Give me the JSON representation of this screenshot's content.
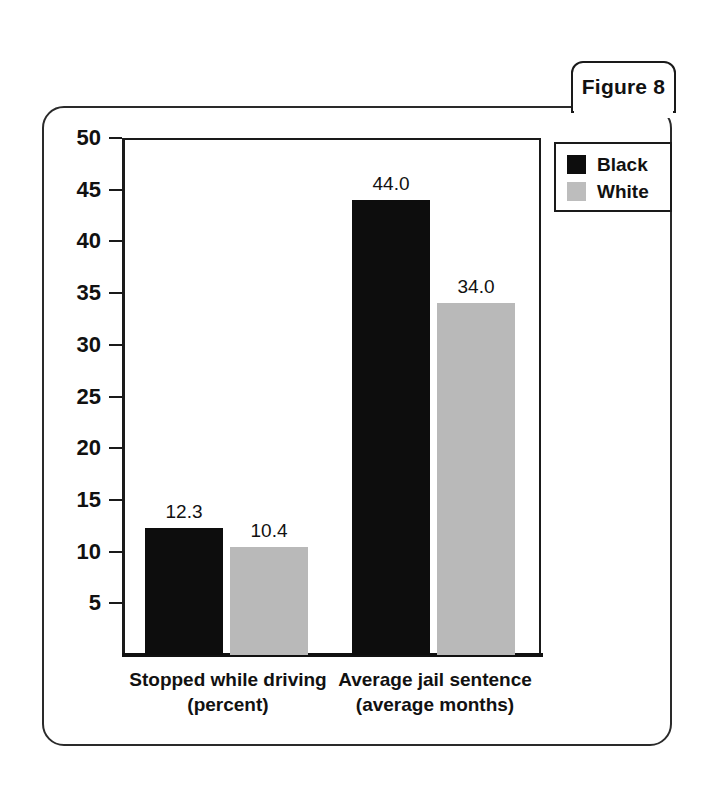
{
  "figure": {
    "tab_label": "Figure 8"
  },
  "legend": {
    "entries": [
      {
        "label": "Black",
        "color": "#0d0d0d",
        "swatch": "black-swatch-icon"
      },
      {
        "label": "White",
        "color": "#bdbdbd",
        "swatch": "white-swatch-icon"
      }
    ]
  },
  "axis": {
    "y_ticks": [
      "50",
      "45",
      "40",
      "35",
      "30",
      "25",
      "20",
      "15",
      "10",
      "5"
    ]
  },
  "categories": [
    {
      "line1": "Stopped while driving",
      "line2": "(percent)"
    },
    {
      "line1": "Average jail sentence",
      "line2": "(average months)"
    }
  ],
  "bar_labels": {
    "g0_black": "12.3",
    "g0_white": "10.4",
    "g1_black": "44.0",
    "g1_white": "34.0"
  },
  "chart_data": {
    "type": "bar",
    "title": "Figure 8",
    "xlabel": "",
    "ylabel": "",
    "ylim": [
      0,
      50
    ],
    "yticks": [
      5,
      10,
      15,
      20,
      25,
      30,
      35,
      40,
      45,
      50
    ],
    "grid": false,
    "legend_position": "top-right",
    "categories": [
      "Stopped while driving (percent)",
      "Average jail sentence (average months)"
    ],
    "series": [
      {
        "name": "Black",
        "color": "#0d0d0d",
        "values": [
          12.3,
          44.0
        ],
        "labels": [
          "12.3",
          "44.0"
        ]
      },
      {
        "name": "White",
        "color": "#bdbdbd",
        "values": [
          10.4,
          34.0
        ],
        "labels": [
          "10.4",
          "34.0"
        ]
      }
    ]
  }
}
